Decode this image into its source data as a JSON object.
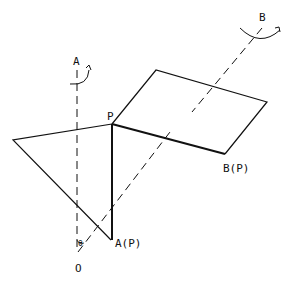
{
  "diagram": {
    "labels": {
      "axis_a": "A",
      "axis_b": "B",
      "point_p": "P",
      "point_ap": "A(P)",
      "point_bp": "B(P)",
      "origin": "O",
      "angle": "θ"
    },
    "colors": {
      "stroke": "#111111",
      "background": "#ffffff"
    }
  }
}
